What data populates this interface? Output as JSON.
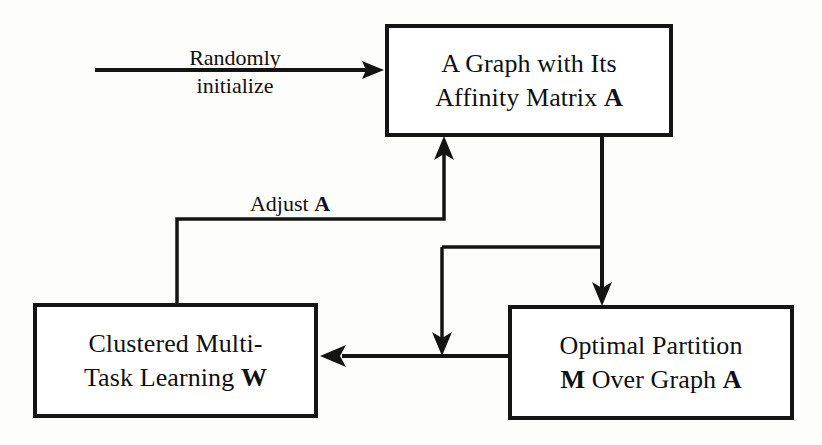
{
  "diagram": {
    "nodes": [
      {
        "id": "graph",
        "line1": "A Graph with Its",
        "line2_pre": "Affinity Matrix ",
        "line2_bold": "A"
      },
      {
        "id": "cmtl",
        "line1": "Clustered Multi-",
        "line2_pre": "Task Learning ",
        "line2_bold": "W"
      },
      {
        "id": "partition",
        "line1": "Optimal Partition",
        "line2_bold": "M",
        "line2_post": " Over Graph ",
        "line2_bold2": "A"
      }
    ],
    "edge_labels": {
      "randomly": "Randomly",
      "initialize": "initialize",
      "adjust_pre": "Adjust ",
      "adjust_bold": "A"
    },
    "colors": {
      "stroke": "#141414",
      "background": "#fdfdfb",
      "node_fill": "#ffffff",
      "text": "#101010"
    }
  }
}
